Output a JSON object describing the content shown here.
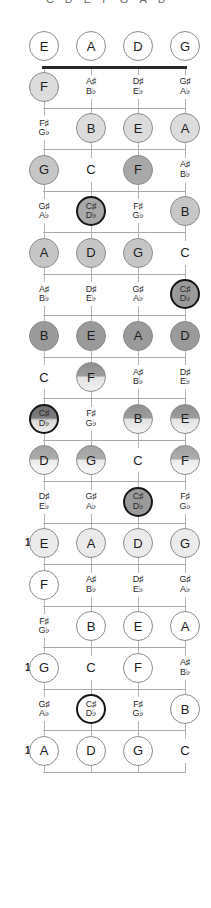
{
  "diagram": {
    "legend_notes": [
      "C",
      "D",
      "E",
      "F",
      "G",
      "A",
      "B"
    ],
    "strings": [
      "E",
      "A",
      "D",
      "G"
    ],
    "open_row_label": "open",
    "marked_fret_numbers": [
      "5",
      "7",
      "9",
      "12",
      "15",
      "17"
    ],
    "colors": {
      "nut": "#2a2a2a",
      "fret_line": "#a9a9a9",
      "string_line": "#b4b4b4",
      "root_ring": "#161616",
      "text": "#1d1d1d"
    }
  },
  "geometry": {
    "string_x": [
      44,
      91,
      138,
      185
    ],
    "nut_y": 66,
    "fret_height": 41.5,
    "open_row_y": 46,
    "circle_d": 30
  },
  "frets": [
    {
      "number": "0",
      "show_number": false,
      "open": true,
      "notes": [
        {
          "label": "E",
          "accidental": false,
          "shape": "circle",
          "tone": "t-white",
          "root": false
        },
        {
          "label": "A",
          "accidental": false,
          "shape": "circle",
          "tone": "t-white",
          "root": false
        },
        {
          "label": "D",
          "accidental": false,
          "shape": "circle",
          "tone": "t-white",
          "root": false
        },
        {
          "label": "G",
          "accidental": false,
          "shape": "circle",
          "tone": "t-white",
          "root": false
        }
      ]
    },
    {
      "number": "1",
      "show_number": false,
      "notes": [
        {
          "label": "F",
          "accidental": false,
          "shape": "circle",
          "tone": "t-light",
          "root": false
        },
        {
          "label": "A♯\nB♭",
          "accidental": true,
          "shape": "text",
          "tone": "",
          "root": false
        },
        {
          "label": "D♯\nE♭",
          "accidental": true,
          "shape": "text",
          "tone": "",
          "root": false
        },
        {
          "label": "G♯\nA♭",
          "accidental": true,
          "shape": "text",
          "tone": "",
          "root": false
        }
      ]
    },
    {
      "number": "2",
      "show_number": false,
      "notes": [
        {
          "label": "F♯\nG♭",
          "accidental": true,
          "shape": "text",
          "tone": "",
          "root": false
        },
        {
          "label": "B",
          "accidental": false,
          "shape": "circle",
          "tone": "t-light",
          "root": false
        },
        {
          "label": "E",
          "accidental": false,
          "shape": "circle",
          "tone": "t-light",
          "root": false
        },
        {
          "label": "A",
          "accidental": false,
          "shape": "circle",
          "tone": "t-light",
          "root": false
        }
      ]
    },
    {
      "number": "3",
      "show_number": false,
      "notes": [
        {
          "label": "G",
          "accidental": false,
          "shape": "circle",
          "tone": "t-mid",
          "root": false
        },
        {
          "label": "C",
          "accidental": false,
          "shape": "text",
          "tone": "",
          "root": false
        },
        {
          "label": "F",
          "accidental": false,
          "shape": "circle",
          "tone": "t-dark",
          "root": false
        },
        {
          "label": "A♯\nB♭",
          "accidental": true,
          "shape": "text",
          "tone": "",
          "root": false
        }
      ]
    },
    {
      "number": "4",
      "show_number": false,
      "notes": [
        {
          "label": "G♯\nA♭",
          "accidental": true,
          "shape": "text",
          "tone": "",
          "root": false
        },
        {
          "label": "C♯\nD♭",
          "accidental": true,
          "shape": "circle",
          "tone": "t-dark",
          "root": true
        },
        {
          "label": "F♯\nG♭",
          "accidental": true,
          "shape": "text",
          "tone": "",
          "root": false
        },
        {
          "label": "B",
          "accidental": false,
          "shape": "circle",
          "tone": "t-mid",
          "root": false
        }
      ]
    },
    {
      "number": "5",
      "show_number": true,
      "notes": [
        {
          "label": "A",
          "accidental": false,
          "shape": "circle",
          "tone": "t-mid",
          "root": false
        },
        {
          "label": "D",
          "accidental": false,
          "shape": "circle",
          "tone": "t-mid",
          "root": false
        },
        {
          "label": "G",
          "accidental": false,
          "shape": "circle",
          "tone": "t-mid",
          "root": false
        },
        {
          "label": "C",
          "accidental": false,
          "shape": "text",
          "tone": "",
          "root": false
        }
      ]
    },
    {
      "number": "6",
      "show_number": false,
      "notes": [
        {
          "label": "A♯\nB♭",
          "accidental": true,
          "shape": "text",
          "tone": "",
          "root": false
        },
        {
          "label": "D♯\nE♭",
          "accidental": true,
          "shape": "text",
          "tone": "",
          "root": false
        },
        {
          "label": "G♯\nA♭",
          "accidental": true,
          "shape": "text",
          "tone": "",
          "root": false
        },
        {
          "label": "C♯\nD♭",
          "accidental": true,
          "shape": "circle",
          "tone": "t-darker",
          "root": true
        }
      ]
    },
    {
      "number": "7",
      "show_number": true,
      "notes": [
        {
          "label": "B",
          "accidental": false,
          "shape": "circle",
          "tone": "t-darker",
          "root": false
        },
        {
          "label": "E",
          "accidental": false,
          "shape": "circle",
          "tone": "t-darker",
          "root": false
        },
        {
          "label": "A",
          "accidental": false,
          "shape": "circle",
          "tone": "t-darker",
          "root": false
        },
        {
          "label": "D",
          "accidental": false,
          "shape": "circle",
          "tone": "t-darker",
          "root": false
        }
      ]
    },
    {
      "number": "8",
      "show_number": false,
      "notes": [
        {
          "label": "C",
          "accidental": false,
          "shape": "text",
          "tone": "",
          "root": false
        },
        {
          "label": "F",
          "accidental": false,
          "shape": "circle",
          "tone": "g-1",
          "root": false
        },
        {
          "label": "A♯\nB♭",
          "accidental": true,
          "shape": "text",
          "tone": "",
          "root": false
        },
        {
          "label": "D♯\nE♭",
          "accidental": true,
          "shape": "text",
          "tone": "",
          "root": false
        }
      ]
    },
    {
      "number": "9",
      "show_number": true,
      "notes": [
        {
          "label": "C♯\nD♭",
          "accidental": true,
          "shape": "circle",
          "tone": "g-3",
          "root": true
        },
        {
          "label": "F♯\nG♭",
          "accidental": true,
          "shape": "text",
          "tone": "",
          "root": false
        },
        {
          "label": "B",
          "accidental": false,
          "shape": "circle",
          "tone": "g-1",
          "root": false
        },
        {
          "label": "E",
          "accidental": false,
          "shape": "circle",
          "tone": "g-1",
          "root": false
        }
      ]
    },
    {
      "number": "10",
      "show_number": false,
      "notes": [
        {
          "label": "D",
          "accidental": false,
          "shape": "circle",
          "tone": "g-2",
          "root": false
        },
        {
          "label": "G",
          "accidental": false,
          "shape": "circle",
          "tone": "g-2",
          "root": false
        },
        {
          "label": "C",
          "accidental": false,
          "shape": "text",
          "tone": "",
          "root": false
        },
        {
          "label": "F",
          "accidental": false,
          "shape": "circle",
          "tone": "g-2",
          "root": false
        }
      ]
    },
    {
      "number": "11",
      "show_number": false,
      "notes": [
        {
          "label": "D♯\nE♭",
          "accidental": true,
          "shape": "text",
          "tone": "",
          "root": false
        },
        {
          "label": "G♯\nA♭",
          "accidental": true,
          "shape": "text",
          "tone": "",
          "root": false
        },
        {
          "label": "C♯\nD♭",
          "accidental": true,
          "shape": "circle",
          "tone": "t-darker",
          "root": true
        },
        {
          "label": "F♯\nG♭",
          "accidental": true,
          "shape": "text",
          "tone": "",
          "root": false
        }
      ]
    },
    {
      "number": "12",
      "show_number": true,
      "notes": [
        {
          "label": "E",
          "accidental": false,
          "shape": "circle",
          "tone": "t-vlight",
          "root": false
        },
        {
          "label": "A",
          "accidental": false,
          "shape": "circle",
          "tone": "t-vlight",
          "root": false
        },
        {
          "label": "D",
          "accidental": false,
          "shape": "circle",
          "tone": "t-vlight",
          "root": false
        },
        {
          "label": "G",
          "accidental": false,
          "shape": "circle",
          "tone": "t-vlight",
          "root": false
        }
      ]
    },
    {
      "number": "13",
      "show_number": false,
      "notes": [
        {
          "label": "F",
          "accidental": false,
          "shape": "circle",
          "tone": "t-white",
          "root": false
        },
        {
          "label": "A♯\nB♭",
          "accidental": true,
          "shape": "text",
          "tone": "",
          "root": false
        },
        {
          "label": "D♯\nE♭",
          "accidental": true,
          "shape": "text",
          "tone": "",
          "root": false
        },
        {
          "label": "G♯\nA♭",
          "accidental": true,
          "shape": "text",
          "tone": "",
          "root": false
        }
      ]
    },
    {
      "number": "14",
      "show_number": false,
      "notes": [
        {
          "label": "F♯\nG♭",
          "accidental": true,
          "shape": "text",
          "tone": "",
          "root": false
        },
        {
          "label": "B",
          "accidental": false,
          "shape": "circle",
          "tone": "t-white",
          "root": false
        },
        {
          "label": "E",
          "accidental": false,
          "shape": "circle",
          "tone": "t-white",
          "root": false
        },
        {
          "label": "A",
          "accidental": false,
          "shape": "circle",
          "tone": "t-white",
          "root": false
        }
      ]
    },
    {
      "number": "15",
      "show_number": true,
      "notes": [
        {
          "label": "G",
          "accidental": false,
          "shape": "circle",
          "tone": "t-white",
          "root": false
        },
        {
          "label": "C",
          "accidental": false,
          "shape": "text",
          "tone": "",
          "root": false
        },
        {
          "label": "F",
          "accidental": false,
          "shape": "circle",
          "tone": "t-white",
          "root": false
        },
        {
          "label": "A♯\nB♭",
          "accidental": true,
          "shape": "text",
          "tone": "",
          "root": false
        }
      ]
    },
    {
      "number": "16",
      "show_number": false,
      "notes": [
        {
          "label": "G♯\nA♭",
          "accidental": true,
          "shape": "text",
          "tone": "",
          "root": false
        },
        {
          "label": "C♯\nD♭",
          "accidental": true,
          "shape": "circle",
          "tone": "t-white",
          "root": true
        },
        {
          "label": "F♯\nG♭",
          "accidental": true,
          "shape": "text",
          "tone": "",
          "root": false
        },
        {
          "label": "B",
          "accidental": false,
          "shape": "circle",
          "tone": "t-white",
          "root": false
        }
      ]
    },
    {
      "number": "17",
      "show_number": true,
      "notes": [
        {
          "label": "A",
          "accidental": false,
          "shape": "circle",
          "tone": "t-white",
          "root": false
        },
        {
          "label": "D",
          "accidental": false,
          "shape": "circle",
          "tone": "t-white",
          "root": false
        },
        {
          "label": "G",
          "accidental": false,
          "shape": "circle",
          "tone": "t-white",
          "root": false
        },
        {
          "label": "C",
          "accidental": false,
          "shape": "text",
          "tone": "",
          "root": false
        }
      ]
    }
  ]
}
